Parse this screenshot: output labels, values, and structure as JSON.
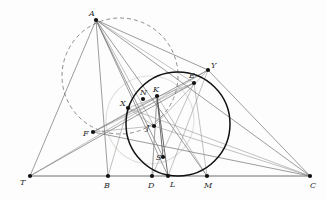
{
  "figure": {
    "width": 326,
    "height": 200,
    "background_color": "#fdfdfd",
    "stroke_color": "#5a5a5a",
    "circle_color": "#111111",
    "dashed_circle_color": "#7a7a7a",
    "point_color": "#111111"
  },
  "points": [
    {
      "id": "A",
      "label": "A",
      "x": 96,
      "y": 20,
      "lx": 89,
      "ly": 16
    },
    {
      "id": "T",
      "label": "T",
      "x": 30,
      "y": 176,
      "lx": 20,
      "ly": 185
    },
    {
      "id": "B",
      "label": "B",
      "x": 108,
      "y": 176,
      "lx": 104,
      "ly": 188
    },
    {
      "id": "D",
      "label": "D",
      "x": 152,
      "y": 176,
      "lx": 148,
      "ly": 188
    },
    {
      "id": "L",
      "label": "L",
      "x": 168,
      "y": 176,
      "lx": 170,
      "ly": 187
    },
    {
      "id": "M",
      "label": "M",
      "x": 207,
      "y": 176,
      "lx": 204,
      "ly": 188
    },
    {
      "id": "C",
      "label": "C",
      "x": 310,
      "y": 176,
      "lx": 310,
      "ly": 188
    },
    {
      "id": "F",
      "label": "F",
      "x": 93,
      "y": 132,
      "lx": 83,
      "ly": 136
    },
    {
      "id": "X",
      "label": "X",
      "x": 128,
      "y": 108,
      "lx": 120,
      "ly": 106
    },
    {
      "id": "N",
      "label": "N",
      "x": 143,
      "y": 99,
      "lx": 140,
      "ly": 95
    },
    {
      "id": "K",
      "label": "K",
      "x": 157,
      "y": 96,
      "lx": 153,
      "ly": 92
    },
    {
      "id": "J",
      "label": "J",
      "x": 154,
      "y": 126,
      "lx": 146,
      "ly": 130
    },
    {
      "id": "S",
      "label": "S",
      "x": 163,
      "y": 157,
      "lx": 156,
      "ly": 160
    },
    {
      "id": "E",
      "label": "E",
      "x": 194,
      "y": 83,
      "lx": 189,
      "ly": 78
    },
    {
      "id": "Y",
      "label": "Y",
      "x": 208,
      "y": 70,
      "lx": 211,
      "ly": 68
    }
  ],
  "circles": [
    {
      "id": "circumcircle",
      "style": "solid",
      "cx": 178,
      "cy": 124,
      "r": 52
    },
    {
      "id": "auxiliary-circle",
      "style": "dashed",
      "cx": 120,
      "cy": 76,
      "r": 58
    },
    {
      "id": "ghost-circle",
      "style": "ghost",
      "cx": 150,
      "cy": 120,
      "r": 44
    }
  ],
  "segments": [
    {
      "from": "T",
      "to": "C",
      "weight": "baseline"
    },
    {
      "from": "A",
      "to": "T",
      "weight": "normal"
    },
    {
      "from": "A",
      "to": "B",
      "weight": "normal"
    },
    {
      "from": "A",
      "to": "C",
      "weight": "normal"
    },
    {
      "from": "A",
      "to": "L",
      "weight": "normal"
    },
    {
      "from": "A",
      "to": "M",
      "weight": "normal"
    },
    {
      "from": "A",
      "to": "S",
      "weight": "normal"
    },
    {
      "from": "A",
      "to": "J",
      "weight": "faint"
    },
    {
      "from": "A",
      "to": "Y",
      "weight": "normal"
    },
    {
      "from": "A",
      "to": "E",
      "weight": "faint"
    },
    {
      "from": "F",
      "to": "C",
      "weight": "normal"
    },
    {
      "from": "F",
      "to": "Y",
      "weight": "normal"
    },
    {
      "from": "F",
      "to": "E",
      "weight": "faint"
    },
    {
      "from": "F",
      "to": "K",
      "weight": "faint"
    },
    {
      "from": "T",
      "to": "E",
      "weight": "normal"
    },
    {
      "from": "T",
      "to": "Y",
      "weight": "faint"
    },
    {
      "from": "K",
      "to": "S",
      "weight": "strong"
    },
    {
      "from": "K",
      "to": "L",
      "weight": "strong"
    },
    {
      "from": "K",
      "to": "D",
      "weight": "faint"
    },
    {
      "from": "K",
      "to": "M",
      "weight": "faint"
    },
    {
      "from": "X",
      "to": "E",
      "weight": "faint"
    },
    {
      "from": "X",
      "to": "C",
      "weight": "faint"
    },
    {
      "from": "D",
      "to": "K",
      "weight": "faint"
    },
    {
      "from": "E",
      "to": "D",
      "weight": "faint"
    },
    {
      "from": "E",
      "to": "M",
      "weight": "faint"
    },
    {
      "from": "Y",
      "to": "C",
      "weight": "normal"
    },
    {
      "from": "Y",
      "to": "L",
      "weight": "faint"
    },
    {
      "from": "J",
      "to": "Y",
      "weight": "faint"
    },
    {
      "from": "J",
      "to": "C",
      "weight": "faint"
    },
    {
      "from": "X",
      "to": "J",
      "weight": "faint"
    },
    {
      "from": "F",
      "to": "J",
      "weight": "faint"
    },
    {
      "from": "B",
      "to": "X",
      "weight": "faint"
    }
  ]
}
